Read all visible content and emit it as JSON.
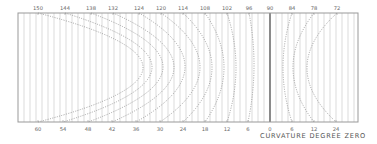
{
  "caption": "CURVATURE DEGREE ZERO",
  "colors": {
    "frame": "#999999",
    "grid": "#c4c4c4",
    "axis_zero": "#555555",
    "curve": "#8a8a8a",
    "label": "#666666"
  },
  "chart_data": {
    "type": "diagram",
    "title": "CURVATURE DEGREE ZERO",
    "frame": {
      "left": 18,
      "right": 358,
      "top": 13,
      "bottom": 122
    },
    "grid_spacing": 6,
    "zero_line_x": 270,
    "top_labels": [
      {
        "text": "150",
        "x": 38
      },
      {
        "text": "144",
        "x": 65
      },
      {
        "text": "138",
        "x": 91
      },
      {
        "text": "132",
        "x": 113
      },
      {
        "text": "124",
        "x": 139
      },
      {
        "text": "120",
        "x": 161
      },
      {
        "text": "114",
        "x": 183
      },
      {
        "text": "108",
        "x": 205
      },
      {
        "text": "102",
        "x": 227
      },
      {
        "text": "96",
        "x": 249
      },
      {
        "text": "90",
        "x": 270
      },
      {
        "text": "84",
        "x": 292
      },
      {
        "text": "78",
        "x": 314
      },
      {
        "text": "72",
        "x": 337
      }
    ],
    "bottom_labels": [
      {
        "text": "60",
        "x": 38
      },
      {
        "text": "54",
        "x": 63
      },
      {
        "text": "48",
        "x": 88
      },
      {
        "text": "42",
        "x": 112
      },
      {
        "text": "36",
        "x": 136
      },
      {
        "text": "30",
        "x": 160
      },
      {
        "text": "24",
        "x": 183
      },
      {
        "text": "18",
        "x": 205
      },
      {
        "text": "12",
        "x": 227
      },
      {
        "text": "6",
        "x": 248
      },
      {
        "text": "0",
        "x": 270
      },
      {
        "text": "6",
        "x": 292
      },
      {
        "text": "12",
        "x": 314
      },
      {
        "text": "24",
        "x": 336
      }
    ],
    "curves": [
      {
        "top_x": 38,
        "bottom_x": 38,
        "vertex_x": 143
      },
      {
        "top_x": 65,
        "bottom_x": 63,
        "vertex_x": 152
      },
      {
        "top_x": 91,
        "bottom_x": 88,
        "vertex_x": 163
      },
      {
        "top_x": 113,
        "bottom_x": 112,
        "vertex_x": 174
      },
      {
        "top_x": 139,
        "bottom_x": 136,
        "vertex_x": 185
      },
      {
        "top_x": 161,
        "bottom_x": 160,
        "vertex_x": 200
      },
      {
        "top_x": 183,
        "bottom_x": 183,
        "vertex_x": 212
      },
      {
        "top_x": 205,
        "bottom_x": 205,
        "vertex_x": 224
      },
      {
        "top_x": 227,
        "bottom_x": 227,
        "vertex_x": 236
      },
      {
        "top_x": 249,
        "bottom_x": 248,
        "vertex_x": 254
      },
      {
        "top_x": 292,
        "bottom_x": 292,
        "vertex_x": 283
      },
      {
        "top_x": 314,
        "bottom_x": 314,
        "vertex_x": 293
      },
      {
        "top_x": 337,
        "bottom_x": 336,
        "vertex_x": 307
      }
    ]
  }
}
